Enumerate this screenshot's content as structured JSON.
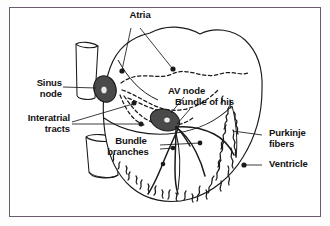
{
  "figure": {
    "border_color": "#6b5a72",
    "background_color": "#ffffff",
    "ink_color": "#1a1a1a",
    "node_fill_color": "#4a4a4a"
  },
  "labels": {
    "atria": "Atria",
    "sinus_node": "Sinus\nnode",
    "sinus_node_line1": "Sinus",
    "sinus_node_line2": "node",
    "interatrial_tracts": "Interatrial\ntracts",
    "interatrial_line1": "Interatrial",
    "interatrial_line2": "tracts",
    "av_node": "AV node",
    "bundle_of_his": "Bundle of his",
    "bundle_branches_line1": "Bundle",
    "bundle_branches_line2": "branches",
    "purkinje_line1": "Purkinje",
    "purkinje_line2": "fibers",
    "ventricle": "Ventricle"
  },
  "structures": {
    "sinus_node_shape": "filled-ellipse",
    "av_node_shape": "filled-ellipse",
    "interatrial_tracts_style": "dashed-curves",
    "bundle_branches_style": "solid-branching-lines",
    "purkinje_fibers_style": "squiggly-fiber-network",
    "great_vessel_top": "superior-vena-cava-tube",
    "great_vessel_bottom": "inferior-vena-cava-tube"
  }
}
